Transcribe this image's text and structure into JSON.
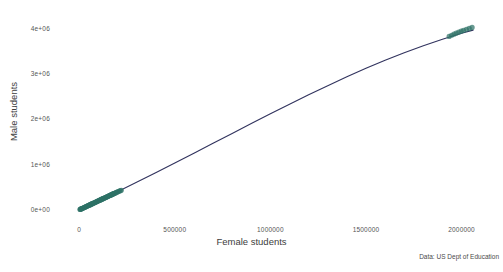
{
  "chart_data": {
    "type": "scatter",
    "title": "Male vs female enrollment",
    "xlabel": "Female students",
    "ylabel": "Male students",
    "source_note": "Data: US Dept of Education",
    "grid": false,
    "legend": "none",
    "xlim": [
      -90000,
      2180000
    ],
    "ylim": [
      -180000,
      4280000
    ],
    "x_ticks": [
      0,
      500000,
      1000000,
      1500000,
      2000000
    ],
    "x_tick_labels": [
      "0",
      "500000",
      "1000000",
      "1500000",
      "2000000"
    ],
    "y_ticks": [
      0,
      1000000,
      2000000,
      3000000,
      4000000
    ],
    "y_tick_labels": [
      "0e+00",
      "1e+06",
      "2e+06",
      "3e+06",
      "4e+06"
    ],
    "point_color": "#2e7266",
    "line_color": "#31335e",
    "series": [
      {
        "name": "States",
        "type": "scatter",
        "x": [
          4200,
          6100,
          8300,
          9800,
          12500,
          15200,
          17800,
          20500,
          23100,
          25900,
          28400,
          31200,
          33800,
          36500,
          39100,
          41800,
          44600,
          47200,
          49900,
          52500,
          55100,
          57800,
          60400,
          63100,
          65700,
          68400,
          71000,
          73700,
          76300,
          79000,
          81600,
          84300,
          86900,
          89600,
          92200,
          94900,
          97500,
          100200,
          102800,
          105500,
          108100,
          110800,
          113400,
          116100,
          118700,
          121400,
          124000,
          126700,
          129300,
          132000,
          134600,
          137300,
          139900,
          142600,
          145200,
          147900,
          150500,
          153200,
          155800,
          158500,
          161100,
          163800,
          166400,
          169100,
          171700,
          174400,
          177000,
          179700,
          182300,
          185000,
          188000,
          192000,
          196000,
          200000,
          205000,
          210000,
          215000,
          220000,
          1935000,
          1948000,
          1960000,
          1972000,
          1985000,
          1998000,
          2010000,
          2025000,
          2040000,
          2055000
        ],
        "y": [
          9000,
          12000,
          16500,
          19500,
          24800,
          30200,
          35400,
          40700,
          45900,
          51400,
          56400,
          61900,
          67100,
          72400,
          77600,
          82900,
          88500,
          93600,
          99000,
          104100,
          109300,
          114600,
          119800,
          125200,
          130300,
          135700,
          140800,
          146100,
          151300,
          156600,
          161800,
          167200,
          172300,
          177700,
          182800,
          188200,
          193300,
          198700,
          203800,
          209200,
          214300,
          219700,
          224800,
          230200,
          235300,
          240700,
          245800,
          251200,
          256300,
          261700,
          266800,
          272200,
          277300,
          282700,
          287800,
          293200,
          298300,
          303700,
          308800,
          314200,
          319300,
          324700,
          329800,
          335200,
          340300,
          345700,
          350800,
          356200,
          361300,
          366700,
          372000,
          380000,
          388000,
          396000,
          405000,
          415000,
          424000,
          433000,
          3830000,
          3855000,
          3878000,
          3900000,
          3922000,
          3944000,
          3962000,
          3985000,
          4005000,
          4028000
        ]
      },
      {
        "name": "Smoothed fit",
        "type": "line",
        "x": [
          0,
          100000,
          200000,
          300000,
          400000,
          500000,
          600000,
          700000,
          800000,
          900000,
          1000000,
          1100000,
          1200000,
          1300000,
          1400000,
          1500000,
          1600000,
          1700000,
          1800000,
          1900000,
          2000000,
          2060000
        ],
        "y": [
          0,
          198000,
          400000,
          608000,
          820000,
          1035000,
          1252000,
          1470000,
          1688000,
          1905000,
          2120000,
          2332000,
          2540000,
          2742000,
          2938000,
          3125000,
          3303000,
          3470000,
          3625000,
          3768000,
          3898000,
          3968000
        ]
      }
    ]
  },
  "axis_titles": {
    "x": "Female students",
    "y": "Male students"
  },
  "footer": {
    "source": "Data: US Dept of Education"
  }
}
